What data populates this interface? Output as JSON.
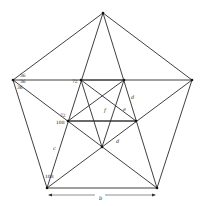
{
  "figure": {
    "vertices": {
      "outer": [
        "A",
        "B",
        "C",
        "D",
        "E"
      ],
      "inner": [
        "P",
        "Q",
        "R",
        "S",
        "T"
      ]
    },
    "angle_labels": {
      "left_top": "36",
      "left_mid": "36",
      "left_bot": "36",
      "inner_top_left": "72",
      "inner_mid_left_top": "72",
      "inner_mid_left_bot": "108",
      "bottom_left": "108"
    },
    "length_labels": {
      "d_right_upper": "d",
      "d_lower": "d",
      "f_center": "f",
      "e_center": "e",
      "c_left": "c",
      "b_bottom": "b"
    }
  }
}
